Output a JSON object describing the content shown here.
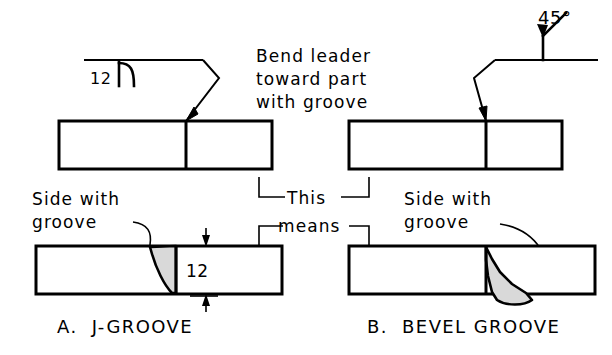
{
  "figure": {
    "background_color": "#ffffff",
    "line_color": "#000000",
    "weld_fill_color": "#d9d9d9"
  },
  "notes": {
    "bend_leader": {
      "line1": "Bend leader",
      "line2": "toward part",
      "line3": "with groove"
    },
    "this": "This",
    "means": "means"
  },
  "panel_a": {
    "caption": "A.  J-GROOVE",
    "symbol_size": "12",
    "symbol_glyph": "j-groove-symbol",
    "side_label_line1": "Side with",
    "side_label_line2": "groove",
    "dimension_value": "12"
  },
  "panel_b": {
    "caption": "B.  BEVEL GROOVE",
    "angle_label": "45°",
    "symbol_glyph": "bevel-groove-symbol",
    "side_label_line1": "Side with",
    "side_label_line2": "groove"
  }
}
